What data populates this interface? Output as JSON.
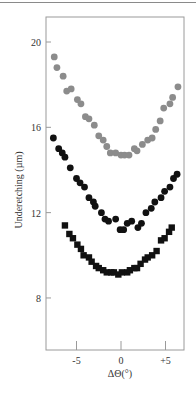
{
  "chart_data": {
    "type": "scatter",
    "title": "",
    "xlabel": "ΔΘ(°)",
    "ylabel": "Underetching (µm)",
    "xlim": [
      -8.4,
      7.1
    ],
    "ylim": [
      6.5,
      21.2
    ],
    "xticks": [
      -5,
      0,
      5
    ],
    "xtick_labels": [
      "-5",
      "0",
      "+5"
    ],
    "yticks": [
      8,
      12,
      16,
      20
    ],
    "ytick_labels": [
      "8",
      "12",
      "16",
      "20"
    ],
    "grid": false,
    "legend": null,
    "series": [
      {
        "name": "gray circles",
        "marker": "circle",
        "color": "#8c8c8c",
        "x": [
          -7.5,
          -7.2,
          -6.5,
          -6.1,
          -5.6,
          -4.9,
          -4.5,
          -4.0,
          -3.6,
          -3.0,
          -2.5,
          -2.0,
          -1.6,
          -1.2,
          -0.6,
          0.0,
          0.4,
          0.9,
          1.5,
          1.8,
          2.4,
          3.0,
          3.5,
          3.9,
          4.4,
          4.8,
          5.5,
          5.8,
          6.4
        ],
        "y": [
          19.3,
          18.8,
          18.4,
          17.7,
          17.8,
          17.3,
          17.1,
          16.5,
          16.4,
          16.1,
          15.6,
          15.4,
          15.1,
          14.8,
          14.8,
          14.7,
          14.7,
          14.7,
          15.0,
          14.9,
          15.2,
          15.4,
          15.5,
          15.9,
          16.3,
          16.9,
          17.1,
          17.4,
          17.9
        ]
      },
      {
        "name": "black circles",
        "marker": "circle",
        "color": "#111111",
        "x": [
          -7.6,
          -7.0,
          -6.6,
          -6.3,
          -5.7,
          -5.0,
          -4.6,
          -4.1,
          -3.6,
          -3.1,
          -2.9,
          -2.2,
          -1.8,
          -1.4,
          -0.6,
          -0.1,
          0.3,
          0.7,
          1.2,
          1.9,
          2.3,
          2.8,
          3.4,
          3.8,
          4.5,
          4.9,
          5.5,
          5.9,
          6.3
        ],
        "y": [
          15.5,
          15.0,
          14.8,
          14.6,
          14.1,
          13.6,
          13.4,
          13.2,
          12.7,
          12.5,
          12.3,
          12.0,
          11.7,
          11.6,
          11.7,
          11.2,
          11.2,
          11.5,
          11.6,
          11.3,
          11.5,
          12.0,
          12.2,
          12.5,
          12.7,
          13.0,
          13.2,
          13.6,
          13.8
        ]
      },
      {
        "name": "black squares",
        "marker": "square",
        "color": "#111111",
        "x": [
          -6.3,
          -5.8,
          -5.4,
          -4.9,
          -4.5,
          -4.2,
          -3.6,
          -3.3,
          -2.8,
          -2.5,
          -2.0,
          -1.6,
          -1.1,
          -0.8,
          -0.3,
          0.1,
          0.7,
          1.0,
          1.5,
          1.8,
          2.2,
          2.7,
          3.0,
          3.5,
          4.0,
          4.5,
          4.9,
          5.4,
          5.7
        ],
        "y": [
          11.4,
          11.0,
          10.8,
          10.5,
          10.3,
          10.0,
          9.9,
          9.7,
          9.5,
          9.4,
          9.3,
          9.2,
          9.2,
          9.2,
          9.1,
          9.2,
          9.2,
          9.3,
          9.4,
          9.4,
          9.6,
          9.8,
          9.9,
          10.0,
          10.2,
          10.7,
          10.8,
          11.1,
          11.3
        ]
      }
    ]
  }
}
